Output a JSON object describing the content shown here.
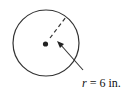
{
  "diagram": {
    "label_var": "r",
    "label_rest": " = 6 in.",
    "colors": {
      "stroke": "#333333",
      "dot": "#222222"
    }
  }
}
